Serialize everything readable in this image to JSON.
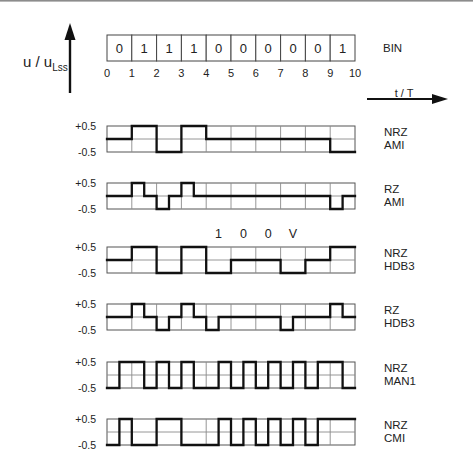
{
  "figure": {
    "y_axis_label": {
      "main": "u / u",
      "subscript": "Lss"
    },
    "x_axis_label": "t / T"
  },
  "chart_data": {
    "type": "line",
    "title": "",
    "xlabel": "t / T",
    "ylabel": "u / u_Lss",
    "xlim": [
      0,
      10
    ],
    "ylim": [
      -0.5,
      0.5
    ],
    "x_ticks": [
      "0",
      "1",
      "2",
      "3",
      "4",
      "5",
      "6",
      "7",
      "8",
      "9",
      "10"
    ],
    "y_tick_labels": [
      "+0.5",
      "-0.5"
    ],
    "grid": true,
    "bits": {
      "label": "BIN",
      "values": [
        0,
        1,
        1,
        1,
        0,
        0,
        0,
        0,
        0,
        1
      ]
    },
    "series": [
      {
        "name": "NRZ AMI",
        "label_lines": [
          "NRZ",
          "AMI"
        ],
        "levels_per_half_bit": [
          0,
          0,
          0.5,
          0.5,
          -0.5,
          -0.5,
          0.5,
          0.5,
          0,
          0,
          0,
          0,
          0,
          0,
          0,
          0,
          0,
          0,
          -0.5,
          -0.5
        ]
      },
      {
        "name": "RZ AMI",
        "label_lines": [
          "RZ",
          "AMI"
        ],
        "levels_per_half_bit": [
          0,
          0,
          0.5,
          0,
          -0.5,
          0,
          0.5,
          0,
          0,
          0,
          0,
          0,
          0,
          0,
          0,
          0,
          0,
          0,
          -0.5,
          0
        ]
      },
      {
        "name": "NRZ HDB3",
        "label_lines": [
          "NRZ",
          "HDB3"
        ],
        "levels_per_half_bit": [
          0,
          0,
          0.5,
          0.5,
          -0.5,
          -0.5,
          0.5,
          0.5,
          -0.5,
          -0.5,
          0,
          0,
          0,
          0,
          -0.5,
          -0.5,
          0,
          0,
          0.5,
          0.5
        ]
      },
      {
        "name": "RZ HDB3",
        "label_lines": [
          "RZ",
          "HDB3"
        ],
        "levels_per_half_bit": [
          0,
          0,
          0.5,
          0,
          -0.5,
          0,
          0.5,
          0,
          -0.5,
          0,
          0,
          0,
          0,
          0,
          -0.5,
          0,
          0,
          0,
          0.5,
          0
        ]
      },
      {
        "name": "NRZ MAN1",
        "label_lines": [
          "NRZ",
          "MAN1"
        ],
        "levels_per_half_bit": [
          -0.5,
          0.5,
          0.5,
          -0.5,
          0.5,
          -0.5,
          0.5,
          -0.5,
          -0.5,
          0.5,
          -0.5,
          0.5,
          -0.5,
          0.5,
          -0.5,
          0.5,
          -0.5,
          0.5,
          0.5,
          -0.5
        ]
      },
      {
        "name": "NRZ CMI",
        "label_lines": [
          "NRZ",
          "CMI"
        ],
        "levels_per_half_bit": [
          -0.5,
          0.5,
          -0.5,
          -0.5,
          0.5,
          0.5,
          -0.5,
          -0.5,
          -0.5,
          0.5,
          -0.5,
          0.5,
          -0.5,
          0.5,
          -0.5,
          0.5,
          -0.5,
          0.5,
          0.5,
          0.5
        ]
      }
    ],
    "annotations": [
      {
        "series": "NRZ HDB3",
        "text": [
          "1",
          "0",
          "0",
          "V"
        ],
        "over_bit_index": [
          4,
          5,
          6,
          7
        ]
      }
    ]
  }
}
